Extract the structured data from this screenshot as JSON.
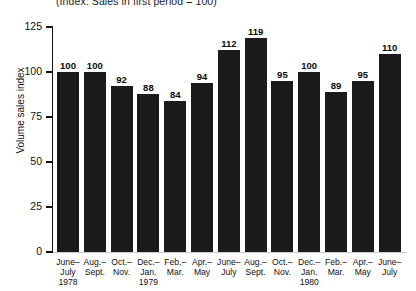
{
  "chart_data": {
    "type": "bar",
    "title": "",
    "subtitle": "(Index: Sales in first period = 100)",
    "xlabel": "",
    "ylabel": "Volume sales index",
    "ylim": [
      0,
      125
    ],
    "yticks": [
      0,
      25,
      50,
      75,
      100,
      125
    ],
    "ytick_labels": [
      "0",
      "25",
      "50",
      "75",
      "100",
      "125"
    ],
    "grid": false,
    "legend": false,
    "bar_color": "#1b1b1b",
    "categories": [
      "June–July 1978",
      "Aug.–Sept.",
      "Oct.–Nov.",
      "Dec.–Jan. 1979",
      "Feb.–Mar.",
      "Apr.–May",
      "June–July",
      "Aug.–Sept.",
      "Oct.–Nov.",
      "Dec.–Jan. 1980",
      "Feb.–Mar.",
      "Apr.–May",
      "June–July"
    ],
    "category_lines": [
      [
        "June–",
        "July",
        "1978"
      ],
      [
        "Aug.–",
        "Sept."
      ],
      [
        "Oct.–",
        "Nov."
      ],
      [
        "Dec.–",
        "Jan.",
        "1979"
      ],
      [
        "Feb.–",
        "Mar."
      ],
      [
        "Apr.–",
        "May"
      ],
      [
        "June–",
        "July"
      ],
      [
        "Aug.–",
        "Sept."
      ],
      [
        "Oct.–",
        "Nov."
      ],
      [
        "Dec.–",
        "Jan.",
        "1980"
      ],
      [
        "Feb.–",
        "Mar."
      ],
      [
        "Apr.–",
        "May"
      ],
      [
        "June–",
        "July"
      ]
    ],
    "values": [
      100,
      100,
      92,
      88,
      84,
      94,
      112,
      119,
      95,
      100,
      89,
      95,
      110
    ],
    "data_labels": [
      "100",
      "100",
      "92",
      "88",
      "84",
      "94",
      "112",
      "119",
      "95",
      "100",
      "89",
      "95",
      "110"
    ]
  }
}
